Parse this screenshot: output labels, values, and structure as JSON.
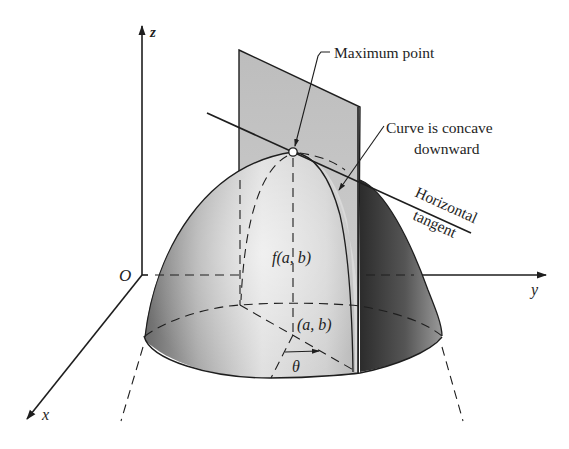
{
  "figure": {
    "type": "3d-surface-diagram",
    "colors": {
      "background": "#ffffff",
      "ink": "#1e1e1e",
      "plane_fill": "#c9c9c9",
      "surface_light": "#ececec",
      "surface_mid": "#bdbdbd",
      "surface_dark": "#3c3c3c"
    }
  },
  "axes": {
    "z_label": "z",
    "x_label": "x",
    "y_label": "y",
    "origin_label": "O"
  },
  "annotations": {
    "maximum_point": "Maximum point",
    "concave_line1": "Curve is concave",
    "concave_line2": "downward",
    "tangent_line1": "Horizontal",
    "tangent_line2": "tangent",
    "f_value": "f(a, b)",
    "base_point": "(a, b)",
    "angle": "θ"
  }
}
